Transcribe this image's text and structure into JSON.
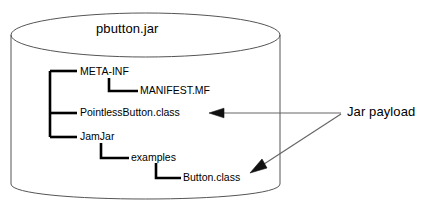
{
  "diagram": {
    "type": "jar-file-structure-cylinder",
    "container": {
      "shape": "cylinder",
      "title": "pbutton.jar",
      "title_position": "top"
    },
    "tree": {
      "root_items": [
        {
          "label": "META-INF",
          "depth": 0
        },
        {
          "label": "MANIFEST.MF",
          "depth": 1
        },
        {
          "label": "PointlessButton.class",
          "depth": 0
        },
        {
          "label": "JamJar",
          "depth": 0
        },
        {
          "label": "examples",
          "depth": 1
        },
        {
          "label": "Button.class",
          "depth": 2
        }
      ]
    },
    "annotation": {
      "label": "Jar payload",
      "arrow_targets": [
        "PointlessButton.class",
        "Button.class"
      ],
      "arrow_count": 2
    },
    "colors": {
      "stroke": "#000000",
      "cylinder_outline": "#555555",
      "arrow": "#666666",
      "text": "#000000",
      "background": "#ffffff"
    },
    "icons": {
      "arrow": "arrow-left-icon",
      "tree_branch": "tree-elbow-icon"
    }
  }
}
